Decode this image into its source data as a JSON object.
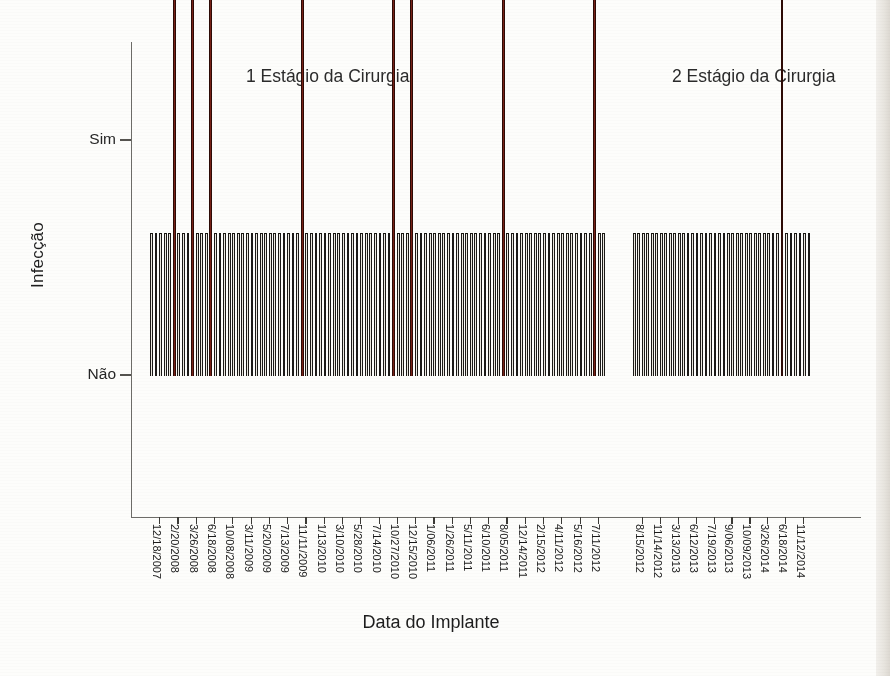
{
  "chart_data": {
    "type": "bar",
    "title": "",
    "panel_titles": [
      "1 Estágio da Cirurgia",
      "2 Estágio da Cirurgia"
    ],
    "xlabel": "Data do Implante",
    "ylabel": "Infecção",
    "ytick_labels": [
      "Sim",
      "Não"
    ],
    "ylim_categories": [
      "Não",
      "Sim"
    ],
    "grid": false,
    "legend": "none",
    "series_colors": {
      "nao": "#ece9e0",
      "sim": "#6d1f14",
      "outline": "#1c1a18"
    },
    "panels": [
      {
        "name": "1 Estágio da Cirurgia",
        "categories": [
          "12/18/2007",
          "2/20/2008",
          "3/26/2008",
          "6/18/2008",
          "10/08/2008",
          "3/11/2009",
          "5/20/2009",
          "7/13/2009",
          "11/11/2009",
          "1/13/2010",
          "3/10/2010",
          "5/28/2010",
          "7/14/2010",
          "10/27/2010",
          "12/15/2010",
          "1/06/2011",
          "1/26/2011",
          "5/11/2011",
          "6/10/2011",
          "8/05/2011",
          "12/14/2011",
          "2/15/2012",
          "4/11/2012",
          "5/16/2012",
          "7/11/2012"
        ],
        "tick_label_indices": [
          0,
          1,
          2,
          3,
          4,
          5,
          6,
          7,
          8,
          9,
          10,
          11,
          12,
          13,
          14,
          15,
          16,
          17,
          18,
          19,
          20,
          21,
          22,
          23,
          24
        ],
        "values": [
          "Não",
          "Sim",
          "Sim",
          "Sim",
          "Não",
          "Não",
          "Não",
          "Não",
          "Sim",
          "Não",
          "Não",
          "Não",
          "Não",
          "Sim",
          "Sim",
          "Não",
          "Não",
          "Não",
          "Não",
          "Sim",
          "Não",
          "Não",
          "Não",
          "Não",
          "Sim"
        ],
        "infection_count": 7,
        "total_count": 25
      },
      {
        "name": "2 Estágio da Cirurgia",
        "categories": [
          "8/15/2012",
          "11/14/2012",
          "3/13/2013",
          "6/12/2013",
          "7/19/2013",
          "9/06/2013",
          "10/09/2013",
          "3/26/2014",
          "6/18/2014",
          "11/12/2014"
        ],
        "tick_label_indices": [
          0,
          1,
          2,
          3,
          4,
          5,
          6,
          7,
          8,
          9
        ],
        "values": [
          "Não",
          "Não",
          "Não",
          "Não",
          "Não",
          "Não",
          "Não",
          "Não",
          "Sim",
          "Não"
        ],
        "infection_count": 1,
        "total_count": 10
      }
    ]
  },
  "axis": {
    "y_title": "Infecção",
    "x_title": "Data do Implante",
    "y_tick_sim": "Sim",
    "y_tick_nao": "Não"
  },
  "panels": {
    "first": "1 Estágio da Cirurgia",
    "second": "2 Estágio da Cirurgia"
  }
}
